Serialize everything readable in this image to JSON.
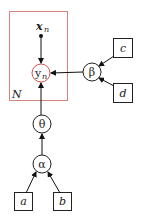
{
  "diagram": {
    "type": "graphical-model",
    "plate": {
      "label": "N",
      "color": "#d9534f"
    },
    "nodes": {
      "x": {
        "label": "x",
        "sub": "n",
        "kind": "observed-point"
      },
      "y": {
        "label": "y",
        "sub": "n",
        "kind": "latent-red"
      },
      "beta": {
        "label": "β",
        "kind": "latent"
      },
      "theta": {
        "label": "θ",
        "kind": "latent"
      },
      "alpha": {
        "label": "α",
        "kind": "latent"
      },
      "c": {
        "label": "c",
        "kind": "fixed"
      },
      "d": {
        "label": "d",
        "kind": "fixed"
      },
      "a": {
        "label": "a",
        "kind": "fixed"
      },
      "b": {
        "label": "b",
        "kind": "fixed"
      }
    },
    "edges": [
      [
        "x",
        "y"
      ],
      [
        "beta",
        "y"
      ],
      [
        "theta",
        "y"
      ],
      [
        "c",
        "beta"
      ],
      [
        "d",
        "beta"
      ],
      [
        "alpha",
        "theta"
      ],
      [
        "a",
        "alpha"
      ],
      [
        "b",
        "alpha"
      ]
    ]
  }
}
